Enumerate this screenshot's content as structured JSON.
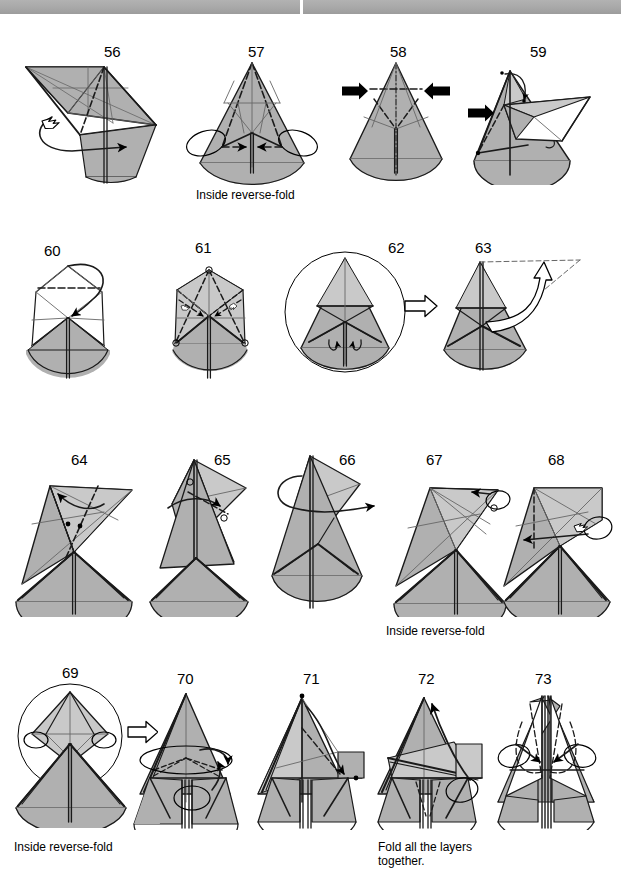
{
  "page": {
    "width": 621,
    "height": 896,
    "background": "#ffffff",
    "header_band_color": "#a8a8a8"
  },
  "colors": {
    "paper_front": "#b0b0b0",
    "paper_back": "#ffffff",
    "paper_shade": "#c9c9c9",
    "line": "#1a1a1a",
    "thin_line": "#666666",
    "arrow": "#000000"
  },
  "steps": [
    {
      "number": "56",
      "number_x": 104,
      "number_y": 44,
      "fig_x": 8,
      "fig_y": 55,
      "fig_w": 152,
      "fig_h": 130,
      "variant": "s56",
      "caption": null
    },
    {
      "number": "57",
      "number_x": 248,
      "number_y": 44,
      "fig_x": 182,
      "fig_y": 55,
      "fig_w": 140,
      "fig_h": 130,
      "variant": "s57",
      "caption": "Inside reverse-fold",
      "caption_x": 196,
      "caption_y": 188
    },
    {
      "number": "58",
      "number_x": 390,
      "number_y": 44,
      "fig_x": 336,
      "fig_y": 55,
      "fig_w": 122,
      "fig_h": 130,
      "variant": "s58",
      "caption": null
    },
    {
      "number": "59",
      "number_x": 530,
      "number_y": 44,
      "fig_x": 458,
      "fig_y": 55,
      "fig_w": 156,
      "fig_h": 130,
      "variant": "s59",
      "caption": null
    },
    {
      "number": "60",
      "number_x": 44,
      "number_y": 243,
      "fig_x": 10,
      "fig_y": 250,
      "fig_w": 120,
      "fig_h": 132,
      "variant": "s60",
      "caption": null
    },
    {
      "number": "61",
      "number_x": 195,
      "number_y": 240,
      "fig_x": 155,
      "fig_y": 250,
      "fig_w": 112,
      "fig_h": 132,
      "variant": "s61",
      "caption": null
    },
    {
      "number": "62",
      "number_x": 388,
      "number_y": 240,
      "fig_x": 283,
      "fig_y": 244,
      "fig_w": 158,
      "fig_h": 138,
      "variant": "s62",
      "caption": null
    },
    {
      "number": "63",
      "number_x": 475,
      "number_y": 240,
      "fig_x": 440,
      "fig_y": 246,
      "fig_w": 168,
      "fig_h": 136,
      "variant": "s63",
      "caption": null
    },
    {
      "number": "64",
      "number_x": 71,
      "number_y": 452,
      "fig_x": 8,
      "fig_y": 462,
      "fig_w": 132,
      "fig_h": 155,
      "variant": "s64",
      "caption": null
    },
    {
      "number": "65",
      "number_x": 214,
      "number_y": 452,
      "fig_x": 138,
      "fig_y": 452,
      "fig_w": 120,
      "fig_h": 165,
      "variant": "s65",
      "caption": null
    },
    {
      "number": "66",
      "number_x": 339,
      "number_y": 452,
      "fig_x": 258,
      "fig_y": 448,
      "fig_w": 132,
      "fig_h": 168,
      "variant": "s66",
      "caption": null
    },
    {
      "number": "67",
      "number_x": 426,
      "number_y": 452,
      "fig_x": 386,
      "fig_y": 462,
      "fig_w": 128,
      "fig_h": 155,
      "variant": "s67",
      "caption": "Inside reverse-fold",
      "caption_x": 386,
      "caption_y": 624
    },
    {
      "number": "68",
      "number_x": 548,
      "number_y": 452,
      "fig_x": 498,
      "fig_y": 462,
      "fig_w": 122,
      "fig_h": 155,
      "variant": "s68",
      "caption": null
    },
    {
      "number": "69",
      "number_x": 62,
      "number_y": 665,
      "fig_x": 6,
      "fig_y": 678,
      "fig_w": 152,
      "fig_h": 150,
      "variant": "s69",
      "caption": "Inside reverse-fold",
      "caption_x": 14,
      "caption_y": 840
    },
    {
      "number": "70",
      "number_x": 177,
      "number_y": 671,
      "fig_x": 130,
      "fig_y": 682,
      "fig_w": 125,
      "fig_h": 148,
      "variant": "s70",
      "caption": null
    },
    {
      "number": "71",
      "number_x": 303,
      "number_y": 671,
      "fig_x": 252,
      "fig_y": 682,
      "fig_w": 124,
      "fig_h": 148,
      "variant": "s71",
      "caption": null
    },
    {
      "number": "72",
      "number_x": 418,
      "number_y": 671,
      "fig_x": 370,
      "fig_y": 682,
      "fig_w": 126,
      "fig_h": 148,
      "variant": "s72",
      "caption": "Fold all the layers\ntogether.",
      "caption_x": 378,
      "caption_y": 840
    },
    {
      "number": "73",
      "number_x": 535,
      "number_y": 671,
      "fig_x": 486,
      "fig_y": 682,
      "fig_w": 130,
      "fig_h": 148,
      "variant": "s73",
      "caption": null
    }
  ],
  "captions": {
    "inside_reverse_fold": "Inside reverse-fold",
    "fold_all_layers": "Fold all the layers\ntogether."
  }
}
